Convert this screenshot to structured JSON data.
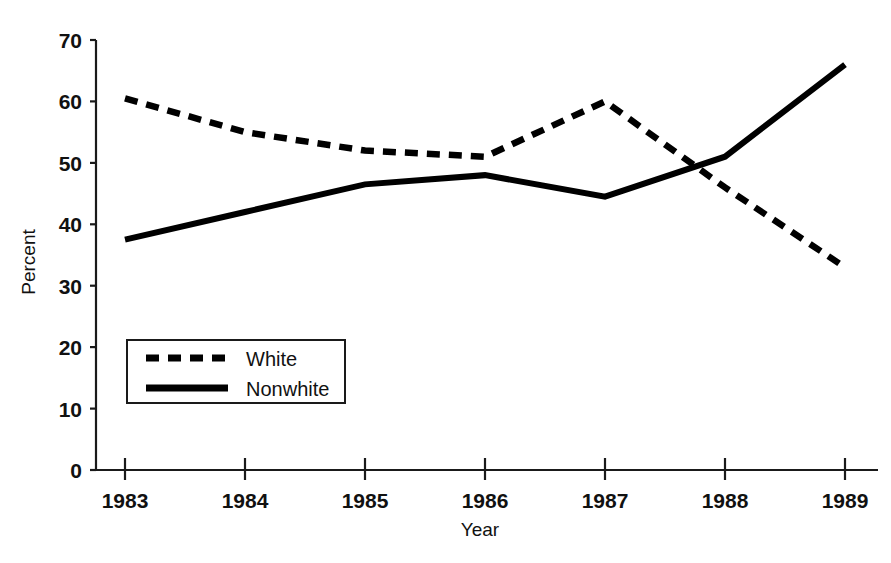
{
  "chart_data": {
    "type": "line",
    "title": "",
    "subtitle": "",
    "xlabel": "Year",
    "ylabel": "Percent",
    "x": [
      1983,
      1984,
      1985,
      1986,
      1987,
      1988,
      1989
    ],
    "categories": [
      "1983",
      "1984",
      "1985",
      "1986",
      "1987",
      "1988",
      "1989"
    ],
    "xlim": [
      1983,
      1989
    ],
    "ylim": [
      0,
      70
    ],
    "y_ticks": [
      0,
      10,
      20,
      30,
      40,
      50,
      60,
      70
    ],
    "y_tick_labels": [
      "0",
      "10",
      "20",
      "30",
      "40",
      "50",
      "60",
      "70"
    ],
    "x_ticks": [
      1983,
      1984,
      1985,
      1986,
      1987,
      1988,
      1989
    ],
    "x_tick_labels": [
      "1983",
      "1984",
      "1985",
      "1986",
      "1987",
      "1988",
      "1989"
    ],
    "grid": false,
    "legend_position": "lower-left",
    "series": [
      {
        "name": "White",
        "style": "dashed",
        "color": "#000000",
        "values": [
          60.5,
          55.0,
          52.0,
          51.0,
          60.0,
          46.0,
          33.0
        ]
      },
      {
        "name": "Nonwhite",
        "style": "solid",
        "color": "#000000",
        "values": [
          37.5,
          42.0,
          46.5,
          48.0,
          44.5,
          51.0,
          66.0
        ]
      }
    ],
    "annotations": []
  },
  "axes": {
    "y_title": "Percent",
    "x_title": "Year"
  },
  "legend": {
    "entries": [
      {
        "label": "White",
        "style": "dashed"
      },
      {
        "label": "Nonwhite",
        "style": "solid"
      }
    ]
  },
  "y_labels": {
    "t0": "0",
    "t1": "10",
    "t2": "20",
    "t3": "30",
    "t4": "40",
    "t5": "50",
    "t6": "60",
    "t7": "70"
  },
  "x_labels": {
    "t0": "1983",
    "t1": "1984",
    "t2": "1985",
    "t3": "1986",
    "t4": "1987",
    "t5": "1988",
    "t6": "1989"
  },
  "colors": {
    "ink": "#000000",
    "axis": "#1a1a1a",
    "background": "#ffffff"
  }
}
